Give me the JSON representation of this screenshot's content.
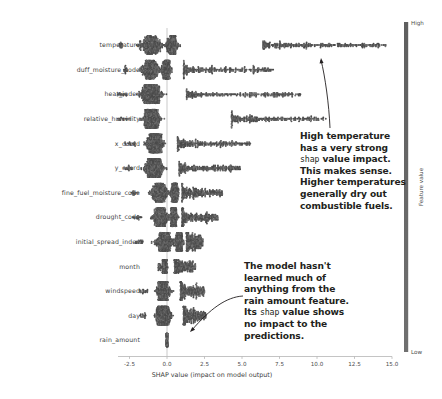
{
  "chart_data": {
    "type": "scatter",
    "title": "",
    "xlabel": "SHAP value (impact on model output)",
    "ylabel": "",
    "xlim": [
      -3.6,
      15.9
    ],
    "xticks": [
      -2.5,
      0.0,
      2.5,
      5.0,
      7.5,
      10.0,
      12.5,
      15.0
    ],
    "xtick_labels": [
      "-2.5",
      "0.0",
      "2.5",
      "5.0",
      "7.5",
      "10.0",
      "12.5",
      "15.0"
    ],
    "grid": false,
    "zero_line": 0.0,
    "legend": {
      "position": "right",
      "title": "Feature value",
      "high_label": "High",
      "low_label": "Low",
      "colors": [
        "#5f5f5f",
        "#707070"
      ]
    },
    "categories": [
      "temperature",
      "duff_moisture_code",
      "heat_index",
      "relative_humidity",
      "x_coord",
      "y_coord",
      "fine_fuel_moisture_code",
      "drought_code",
      "initial_spread_index",
      "month",
      "windspeed",
      "day",
      "rain_amount"
    ],
    "series": [
      {
        "name": "temperature",
        "x_range": [
          -3.2,
          14.6
        ],
        "dense_core": [
          -3.1,
          0.9
        ],
        "tail_cluster": [
          6.4,
          14.6
        ],
        "spread": 17.8
      },
      {
        "name": "duff_moisture_code",
        "x_range": [
          -2.9,
          7.1
        ],
        "dense_core": [
          -2.6,
          0.4
        ],
        "tail_cluster": [
          1.1,
          7.1
        ],
        "spread": 10.0
      },
      {
        "name": "heat_index",
        "x_range": [
          -3.3,
          9.0
        ],
        "dense_core": [
          -2.7,
          0.6
        ],
        "tail_cluster": [
          1.3,
          9.0
        ],
        "spread": 12.3
      },
      {
        "name": "relative_humidity",
        "x_range": [
          -3.4,
          10.6
        ],
        "dense_core": [
          -2.4,
          0.3
        ],
        "tail_cluster": [
          4.3,
          10.6
        ],
        "spread": 14.0
      },
      {
        "name": "x_coord",
        "x_range": [
          -2.8,
          5.6
        ],
        "dense_core": [
          -2.1,
          0.5
        ],
        "tail_cluster": [
          0.7,
          5.6
        ],
        "spread": 8.4
      },
      {
        "name": "y_coord",
        "x_range": [
          -2.9,
          4.9
        ],
        "dense_core": [
          -2.3,
          0.6
        ],
        "tail_cluster": [
          0.8,
          4.9
        ],
        "spread": 7.8
      },
      {
        "name": "fine_fuel_moisture_code",
        "x_range": [
          -2.4,
          3.7
        ],
        "dense_core": [
          -1.9,
          0.9
        ],
        "tail_cluster": [
          1.0,
          3.7
        ],
        "spread": 6.1
      },
      {
        "name": "drought_code",
        "x_range": [
          -2.3,
          3.4
        ],
        "dense_core": [
          -1.7,
          0.8
        ],
        "tail_cluster": [
          1.0,
          3.4
        ],
        "spread": 5.7
      },
      {
        "name": "initial_spread_index",
        "x_range": [
          -2.1,
          2.4
        ],
        "dense_core": [
          -1.6,
          1.2
        ],
        "tail_cluster": [
          1.3,
          2.4
        ],
        "spread": 4.5
      },
      {
        "name": "month",
        "x_range": [
          -0.6,
          1.9
        ],
        "dense_core": [
          -0.5,
          0.2
        ],
        "tail_cluster": [
          0.5,
          1.9
        ],
        "spread": 2.5
      },
      {
        "name": "windspeed",
        "x_range": [
          -1.9,
          2.5
        ],
        "dense_core": [
          -1.3,
          0.8
        ],
        "tail_cluster": [
          0.9,
          2.5
        ],
        "spread": 4.4
      },
      {
        "name": "day",
        "x_range": [
          -1.8,
          2.6
        ],
        "dense_core": [
          -1.4,
          0.9
        ],
        "tail_cluster": [
          1.1,
          2.6
        ],
        "spread": 4.4
      },
      {
        "name": "rain_amount",
        "x_range": [
          -0.03,
          0.03
        ],
        "dense_core": [
          -0.02,
          0.02
        ],
        "tail_cluster": [
          0.0,
          0.0
        ],
        "spread": 0.06
      }
    ]
  },
  "annotations": [
    {
      "name": "temperature-annotation",
      "lines": [
        [
          {
            "t": "High temperature",
            "mono": false
          }
        ],
        [
          {
            "t": "has a very strong",
            "mono": false
          }
        ],
        [
          {
            "t": "shap",
            "mono": true
          },
          {
            "t": " value impact.",
            "mono": false
          }
        ],
        [
          {
            "t": "This makes sense.",
            "mono": false
          }
        ],
        [
          {
            "t": "Higher temperatures",
            "mono": false
          }
        ],
        [
          {
            "t": "generally dry out",
            "mono": false
          }
        ],
        [
          {
            "t": "combustible fuels.",
            "mono": false
          }
        ]
      ]
    },
    {
      "name": "rain-amount-annotation",
      "lines": [
        [
          {
            "t": "The model hasn't",
            "mono": false
          }
        ],
        [
          {
            "t": "learned much of",
            "mono": false
          }
        ],
        [
          {
            "t": "anything from the",
            "mono": false
          }
        ],
        [
          {
            "t": "rain amount feature.",
            "mono": false
          }
        ],
        [
          {
            "t": "Its ",
            "mono": false
          },
          {
            "t": "shap",
            "mono": true
          },
          {
            "t": " value shows",
            "mono": false
          }
        ],
        [
          {
            "t": "no impact to the",
            "mono": false
          }
        ],
        [
          {
            "t": "predictions.",
            "mono": false
          }
        ]
      ]
    }
  ]
}
